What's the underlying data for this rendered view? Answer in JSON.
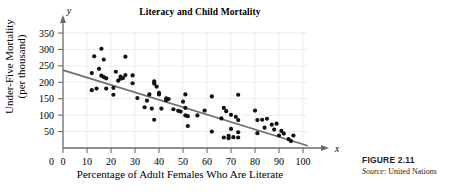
{
  "figure": {
    "number_label": "FIGURE 2.11",
    "source_word": "Source",
    "source_text": ": United Nations"
  },
  "chart_data": {
    "type": "scatter",
    "title": "Literacy and Child Mortality",
    "xlabel": "Percentage of Adult Females Who Are Literate",
    "ylabel_line1": "Under-Five Mortality",
    "ylabel_line2": "(per thousand)",
    "x_axis_variable": "x",
    "y_axis_variable": "y",
    "grid": true,
    "legend": "none",
    "xlim": [
      0,
      100
    ],
    "ylim": [
      0,
      350
    ],
    "xticks": [
      0,
      10,
      20,
      30,
      40,
      50,
      60,
      70,
      80,
      90,
      100
    ],
    "yticks": [
      0,
      50,
      100,
      150,
      200,
      250,
      300,
      350
    ],
    "point_color": "#111111",
    "line_color": "#6f6f6f",
    "grid_color": "#ebebeb",
    "axis_color": "#6b6b6b",
    "trendline": {
      "label": "regression line",
      "x_start": 0,
      "y_start": 237,
      "x_end": 102,
      "y_end": 7
    },
    "points": [
      [
        12,
        228
      ],
      [
        12,
        176
      ],
      [
        13,
        279
      ],
      [
        14,
        181
      ],
      [
        15,
        241
      ],
      [
        16,
        302
      ],
      [
        16,
        220
      ],
      [
        17,
        269
      ],
      [
        17,
        216
      ],
      [
        18,
        212
      ],
      [
        18,
        181
      ],
      [
        21,
        183
      ],
      [
        21,
        162
      ],
      [
        22,
        232
      ],
      [
        23,
        205
      ],
      [
        24,
        217
      ],
      [
        24,
        211
      ],
      [
        25,
        213
      ],
      [
        26,
        278
      ],
      [
        26,
        222
      ],
      [
        29,
        197
      ],
      [
        29,
        221
      ],
      [
        31,
        152
      ],
      [
        34,
        124
      ],
      [
        35,
        144
      ],
      [
        36,
        163
      ],
      [
        37,
        120
      ],
      [
        38,
        203
      ],
      [
        38,
        196
      ],
      [
        38,
        86
      ],
      [
        39,
        187
      ],
      [
        40,
        168
      ],
      [
        40,
        163
      ],
      [
        41,
        120
      ],
      [
        43,
        145
      ],
      [
        43,
        151
      ],
      [
        44,
        149
      ],
      [
        46,
        118
      ],
      [
        48,
        113
      ],
      [
        49,
        111
      ],
      [
        50,
        141
      ],
      [
        51,
        163
      ],
      [
        51,
        99
      ],
      [
        51,
        122
      ],
      [
        52,
        97
      ],
      [
        52,
        67
      ],
      [
        56,
        99
      ],
      [
        59,
        114
      ],
      [
        62,
        157
      ],
      [
        62,
        50
      ],
      [
        66,
        90
      ],
      [
        67,
        122
      ],
      [
        67,
        32
      ],
      [
        68,
        112
      ],
      [
        69,
        37
      ],
      [
        69,
        30
      ],
      [
        70,
        101
      ],
      [
        70,
        58
      ],
      [
        71,
        33
      ],
      [
        72,
        95
      ],
      [
        73,
        162
      ],
      [
        73,
        85
      ],
      [
        73,
        48
      ],
      [
        73,
        32
      ],
      [
        80,
        114
      ],
      [
        81,
        85
      ],
      [
        81,
        45
      ],
      [
        83,
        86
      ],
      [
        84,
        62
      ],
      [
        85,
        89
      ],
      [
        87,
        71
      ],
      [
        88,
        56
      ],
      [
        89,
        74
      ],
      [
        90,
        38
      ],
      [
        91,
        52
      ],
      [
        92,
        44
      ],
      [
        94,
        27
      ],
      [
        95,
        21
      ],
      [
        96,
        38
      ]
    ]
  }
}
